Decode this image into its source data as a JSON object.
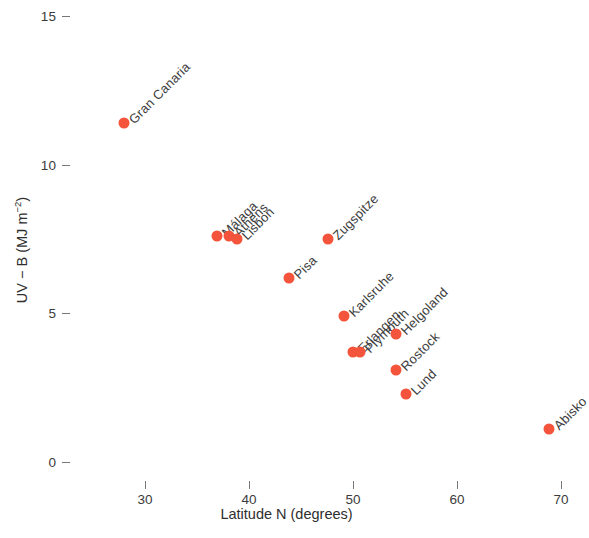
{
  "chart_data": {
    "type": "scatter",
    "title": "",
    "xlabel": "Latitude N (degrees)",
    "ylabel": "UV − B (MJ m−2)",
    "ylabel_base": "UV − B (MJ m",
    "ylabel_exp": "−2",
    "ylabel_close": ")",
    "xlim": [
      25.5,
      72
    ],
    "ylim": [
      -0.4,
      15.7
    ],
    "xticks": [
      30,
      40,
      50,
      60,
      70
    ],
    "xtick_labels": [
      "30",
      "40",
      "50",
      "60",
      "70"
    ],
    "yticks": [
      0,
      5,
      10,
      15
    ],
    "ytick_labels": [
      "0",
      "5",
      "10",
      "15"
    ],
    "grid": false,
    "legend": "none",
    "marker_color": "#f4543c",
    "marker_size_px": 11,
    "label_rotation_deg": 45,
    "points": [
      {
        "name": "Gran Canaria",
        "x": 28.0,
        "y": 11.4
      },
      {
        "name": "Málaga",
        "x": 36.9,
        "y": 7.6
      },
      {
        "name": "Athens",
        "x": 38.1,
        "y": 7.6
      },
      {
        "name": "Lisbon",
        "x": 38.8,
        "y": 7.5
      },
      {
        "name": "Pisa",
        "x": 43.8,
        "y": 6.2
      },
      {
        "name": "Zugspitze",
        "x": 47.6,
        "y": 7.5
      },
      {
        "name": "Karlsruhe",
        "x": 49.1,
        "y": 4.9
      },
      {
        "name": "Erlangen",
        "x": 50.0,
        "y": 3.7
      },
      {
        "name": "Plymouth",
        "x": 50.7,
        "y": 3.7
      },
      {
        "name": "Helgoland",
        "x": 54.1,
        "y": 4.3
      },
      {
        "name": "Rostock",
        "x": 54.1,
        "y": 3.1
      },
      {
        "name": "Lund",
        "x": 55.1,
        "y": 2.3
      },
      {
        "name": "Abisko",
        "x": 68.8,
        "y": 1.1
      }
    ]
  }
}
